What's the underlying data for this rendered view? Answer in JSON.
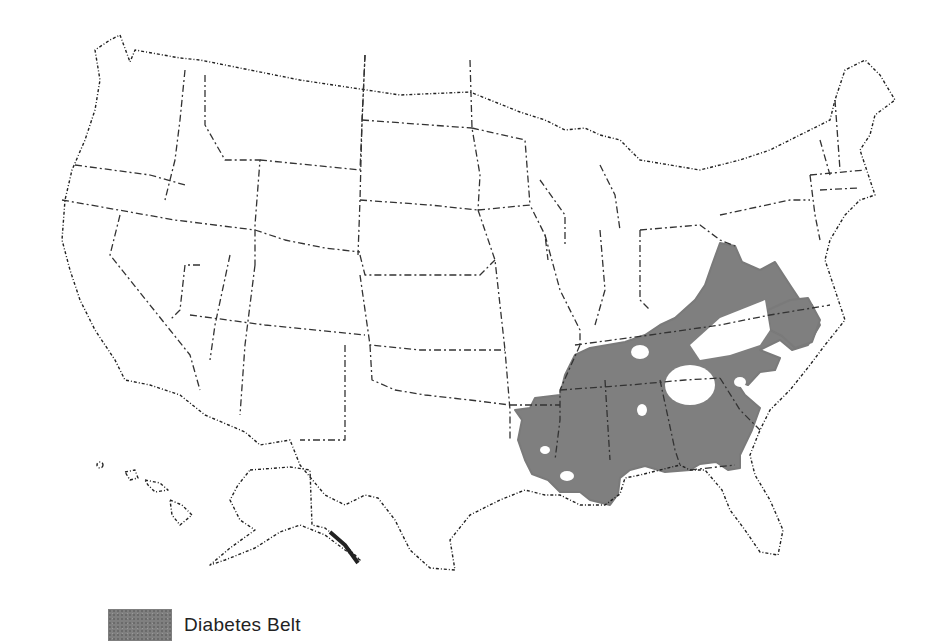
{
  "map": {
    "subject": "Contiguous United States with Alaska and Hawaii insets",
    "highlighted_region": "Diabetes Belt",
    "colors": {
      "background": "#ffffff",
      "outline": "#333333",
      "belt_fill": "#7f7f7f"
    }
  },
  "legend": {
    "items": [
      {
        "label": "Diabetes Belt",
        "color": "#7f7f7f"
      }
    ]
  }
}
